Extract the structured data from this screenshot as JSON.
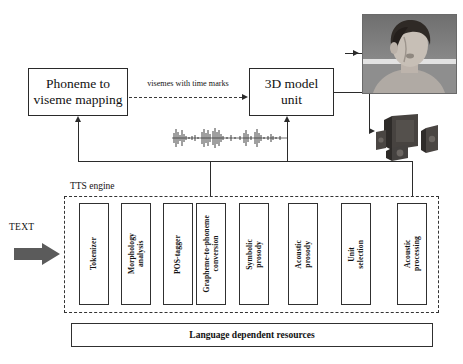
{
  "diagram": {
    "top_blocks": {
      "phoneme_mapping": "Phoneme to\nviseme mapping",
      "model_unit": "3D model\nunit"
    },
    "edge_labels": {
      "visemes": "visemes with time marks"
    },
    "input": {
      "text_label": "TEXT"
    },
    "tts_engine": {
      "label": "TTS engine",
      "stages": [
        {
          "label": "Tokenizer"
        },
        {
          "label": "Morphology\nanalysis"
        },
        {
          "label": "POS-tagger"
        },
        {
          "label": "Grapheme-to-phoneme\nconversion"
        },
        {
          "label": "Symbolic\nprosody"
        },
        {
          "label": "Acoustic\nprosody"
        },
        {
          "label": "Unit\nselection"
        },
        {
          "label": "Acoustic\nprocessing"
        }
      ]
    },
    "resources": {
      "label": "Language dependent resources"
    },
    "outputs": {
      "face_image_alt": "3D animated talking head",
      "speakers_alt": "loudspeaker set",
      "waveform_alt": "synthesized speech waveform"
    },
    "colors": {
      "stroke": "#2b2b2b",
      "arrow_fill": "#4c4c4c",
      "background": "#ffffff"
    }
  }
}
